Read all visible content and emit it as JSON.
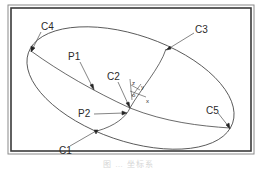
{
  "diagram": {
    "type": "ellipse-with-curves",
    "frame": {
      "stroke": "#3a3a3a",
      "background": "#ffffff"
    },
    "labels": {
      "c1": "C1",
      "c2": "C2",
      "c3": "C3",
      "c4": "C4",
      "c5": "C5",
      "p1": "P1",
      "p2": "P2"
    },
    "axes": {
      "z": "z",
      "y": "y",
      "x": "x",
      "origin": "o"
    },
    "colors": {
      "line": "#333333",
      "label": "#2a2a2a"
    }
  },
  "caption": "图 … 坐标系"
}
